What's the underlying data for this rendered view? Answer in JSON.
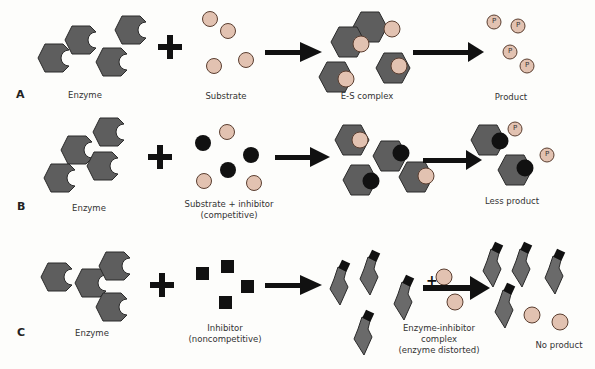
{
  "colors": {
    "enzyme": "#5e5e5e",
    "substrate": "#e2c2b1",
    "inhibitor": "#111111",
    "arrow": "#111111"
  },
  "rows": [
    {
      "letter": "A",
      "labels": {
        "enzyme": "Enzyme",
        "substrate": "Substrate",
        "complex": "E-S complex",
        "result": "Product"
      }
    },
    {
      "letter": "B",
      "labels": {
        "enzyme": "Enzyme",
        "substrate_line1": "Substrate + inhibitor",
        "substrate_line2": "(competitive)",
        "result": "Less product"
      }
    },
    {
      "letter": "C",
      "labels": {
        "enzyme": "Enzyme",
        "inhibitor_line1": "Inhibitor",
        "inhibitor_line2": "(noncompetitive)",
        "complex_line1": "Enzyme-inhibitor",
        "complex_line2": "complex",
        "complex_line3": "(enzyme distorted)",
        "result": "No product"
      }
    }
  ],
  "product_symbol": "P",
  "plus_symbol": "+"
}
